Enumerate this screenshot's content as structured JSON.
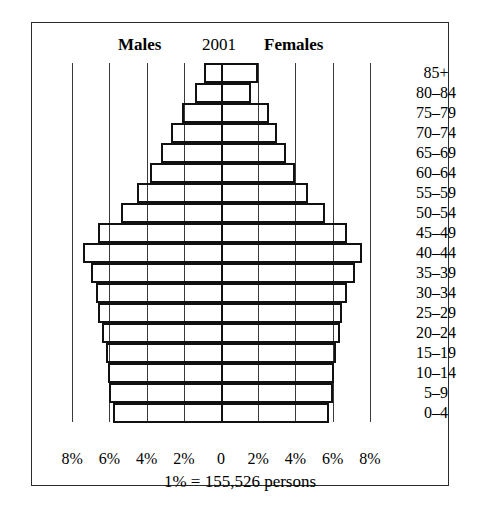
{
  "figure": {
    "title_left": "Males",
    "title_center": "2001",
    "title_right": "Females",
    "footnote": "1% = 155,526 persons"
  },
  "chart_data": {
    "type": "bar",
    "subtype": "population-pyramid",
    "title": "2001",
    "xlabel": "",
    "ylabel": "",
    "grid": true,
    "legend_position": "top",
    "left_series_name": "Males",
    "right_series_name": "Females",
    "footnote": "1% = 155,526 persons",
    "percent_unit_persons": 155526,
    "xlim": [
      -8,
      8
    ],
    "xtick_values": [
      -8,
      -6,
      -4,
      -2,
      0,
      2,
      4,
      6,
      8
    ],
    "xtick_labels": [
      "8%",
      "6%",
      "4%",
      "2%",
      "0",
      "2%",
      "4%",
      "6%",
      "8%"
    ],
    "categories": [
      "85+",
      "80–84",
      "75–79",
      "70–74",
      "65–69",
      "60–64",
      "55–59",
      "50–54",
      "45–49",
      "40–44",
      "35–39",
      "30–34",
      "25–29",
      "20–24",
      "15–19",
      "10–14",
      "5–9",
      "0–4"
    ],
    "series": [
      {
        "name": "Males",
        "side": "left",
        "values": [
          0.9,
          1.4,
          2.1,
          2.7,
          3.2,
          3.8,
          4.5,
          5.4,
          6.6,
          7.4,
          7.0,
          6.7,
          6.6,
          6.4,
          6.2,
          6.1,
          6.0,
          5.8
        ]
      },
      {
        "name": "Females",
        "side": "right",
        "values": [
          2.0,
          1.6,
          2.6,
          3.0,
          3.5,
          4.0,
          4.7,
          5.6,
          6.8,
          7.6,
          7.2,
          6.8,
          6.5,
          6.4,
          6.2,
          6.1,
          6.0,
          5.8
        ]
      }
    ]
  }
}
